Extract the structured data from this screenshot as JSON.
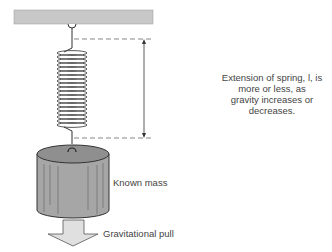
{
  "diagram": {
    "labels": {
      "extension": "Extension of spring, l, is more or less, as gravity increases or decreases.",
      "extension_line1": "Extension of spring, l, is more or less, as",
      "extension_line2": "gravity increases or decreases.",
      "mass": "Known mass",
      "pull": "Gravitational pull"
    },
    "colors": {
      "ceiling": "#c8c8c8",
      "mass_body": "#a6a6a6",
      "mass_top": "#8f8f8f",
      "arrow": "#e0e0e0",
      "line": "#333333",
      "text": "#444444"
    }
  }
}
